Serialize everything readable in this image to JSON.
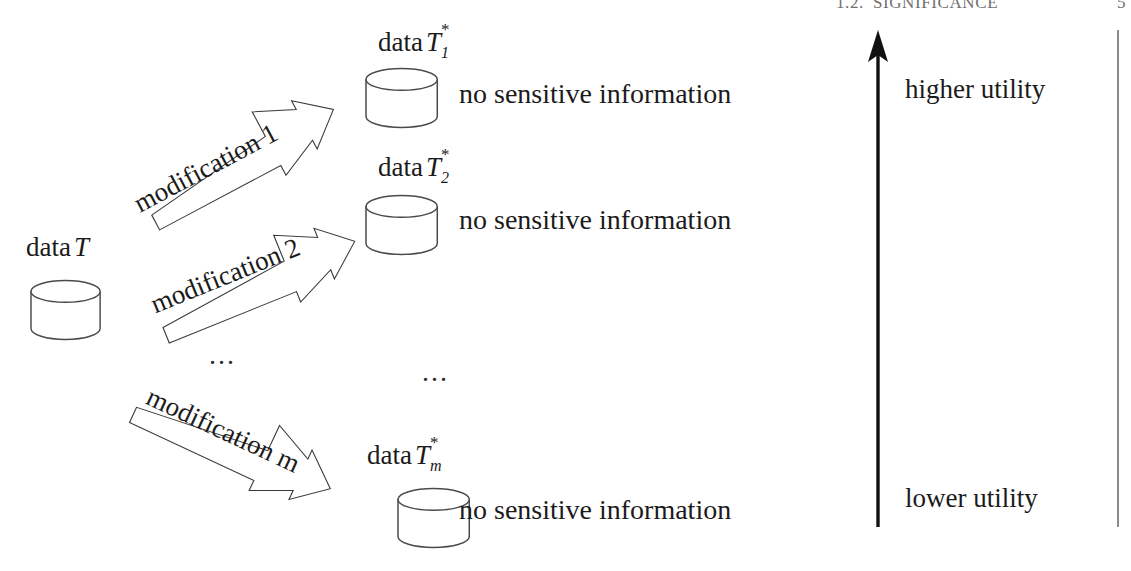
{
  "page": {
    "running_header": {
      "section_number": "1.2.",
      "section_title": "SIGNIFICANCE",
      "page_number": "5"
    },
    "width": 1131,
    "height": 571,
    "background": "#ffffff",
    "ink_color": "#1b1b1b"
  },
  "source": {
    "label_prefix": "data",
    "label_var": "T",
    "icon": "database-cylinder"
  },
  "arrows": [
    {
      "id": "modification-1",
      "label": "modification 1",
      "rotation_deg": -28,
      "direction": "up-right"
    },
    {
      "id": "modification-2",
      "label": "modification 2",
      "rotation_deg": -22,
      "direction": "up-right"
    },
    {
      "id": "modification-m",
      "label": "modification m",
      "rotation_deg": 25,
      "direction": "down-right"
    }
  ],
  "outputs": [
    {
      "id": "output-1",
      "label_prefix": "data",
      "label_var": "T",
      "label_sub": "1",
      "label_sup": "*",
      "note": "no sensitive information",
      "icon": "database-cylinder"
    },
    {
      "id": "output-2",
      "label_prefix": "data",
      "label_var": "T",
      "label_sub": "2",
      "label_sup": "*",
      "note": "no sensitive information",
      "icon": "database-cylinder"
    },
    {
      "id": "output-m",
      "label_prefix": "data",
      "label_var": "T",
      "label_sub": "m",
      "label_sup": "*",
      "note": "no sensitive information",
      "icon": "database-cylinder"
    }
  ],
  "ellipses": {
    "arrows_column": "...",
    "outputs_column": "..."
  },
  "utility_axis": {
    "top_label": "higher utility",
    "bottom_label": "lower utility",
    "arrow_direction": "up",
    "arrow_color": "#111111"
  },
  "margin_rule": {
    "present": true,
    "color": "#8a8a8a"
  }
}
